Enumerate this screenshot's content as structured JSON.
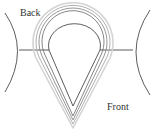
{
  "diagram": {
    "labels": {
      "back": "Back",
      "front": "Front"
    },
    "colors": {
      "line": "#333333",
      "outer_rings": [
        "#555555",
        "#888888",
        "#aaaaaa",
        "#cccccc"
      ]
    }
  }
}
